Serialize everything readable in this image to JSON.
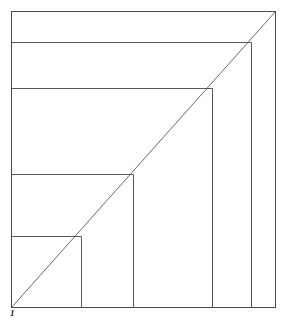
{
  "figure": {
    "title": "",
    "label_bottom_left": "1",
    "stroke_color": "#585858",
    "frame_color": "#4a4a4a",
    "diagonal_color": "#6a6a6a",
    "background_color": "#ffffff"
  },
  "chart_data": {
    "type": "line",
    "title": "",
    "subtitle": "",
    "xlabel": "",
    "ylabel": "",
    "xlim": [
      0,
      1
    ],
    "ylim": [
      0,
      1
    ],
    "grid": false,
    "legend": "none",
    "annotations": [
      {
        "text": "1",
        "x": 0,
        "y": 0,
        "position": "bottom-left",
        "style": "bold-italic"
      }
    ],
    "frame": {
      "x0": 11,
      "y0": 11,
      "x1": 275,
      "y1": 307
    },
    "series": [
      {
        "name": "diagonal",
        "type": "line",
        "points": [
          {
            "x": 11,
            "y": 307
          },
          {
            "x": 275,
            "y": 11
          }
        ]
      },
      {
        "name": "step-verticals",
        "type": "segments",
        "segments": [
          {
            "x1": 81,
            "y1": 307,
            "x2": 81,
            "y2": 236
          },
          {
            "x1": 133,
            "y1": 307,
            "x2": 133,
            "y2": 174
          },
          {
            "x1": 212,
            "y1": 307,
            "x2": 212,
            "y2": 88
          },
          {
            "x1": 251,
            "y1": 307,
            "x2": 251,
            "y2": 42
          }
        ]
      },
      {
        "name": "step-horizontals",
        "type": "segments",
        "segments": [
          {
            "x1": 11,
            "y1": 236,
            "x2": 81,
            "y2": 236
          },
          {
            "x1": 11,
            "y1": 174,
            "x2": 133,
            "y2": 174
          },
          {
            "x1": 11,
            "y1": 88,
            "x2": 212,
            "y2": 88
          },
          {
            "x1": 11,
            "y1": 42,
            "x2": 251,
            "y2": 42
          }
        ]
      }
    ],
    "rectangles": [
      {
        "index": 1,
        "x0": 11,
        "y0": 236,
        "x1": 81,
        "y1": 307,
        "corner_on_diagonal": {
          "x": 81,
          "y": 236
        }
      },
      {
        "index": 2,
        "x0": 11,
        "y0": 174,
        "x1": 133,
        "y1": 307,
        "corner_on_diagonal": {
          "x": 133,
          "y": 174
        }
      },
      {
        "index": 3,
        "x0": 11,
        "y0": 88,
        "x1": 212,
        "y1": 307,
        "corner_on_diagonal": {
          "x": 212,
          "y": 88
        }
      },
      {
        "index": 4,
        "x0": 11,
        "y0": 42,
        "x1": 251,
        "y1": 307,
        "corner_on_diagonal": {
          "x": 251,
          "y": 42
        }
      }
    ]
  }
}
